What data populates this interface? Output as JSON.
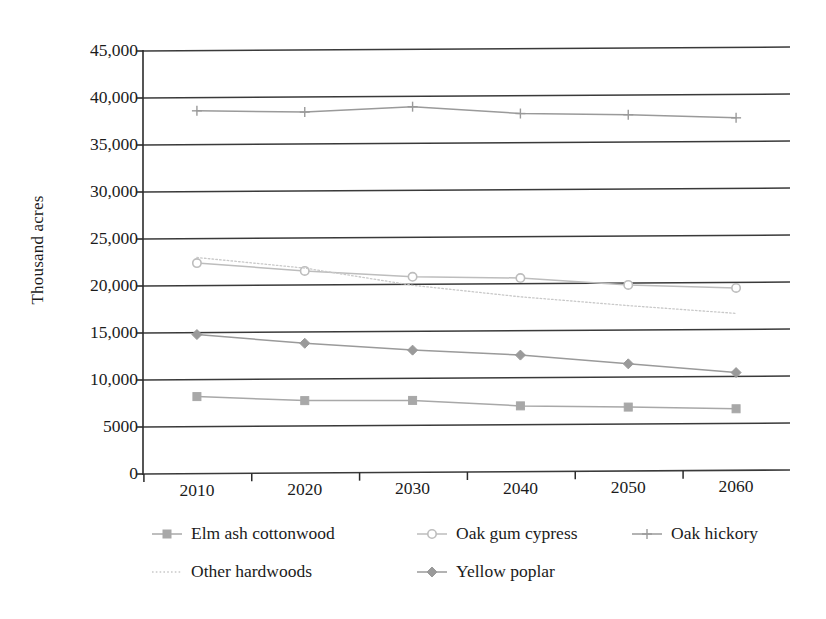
{
  "chart_data": {
    "type": "line",
    "title": "",
    "xlabel": "",
    "ylabel": "Thousand acres",
    "x": [
      2010,
      2020,
      2030,
      2040,
      2050,
      2060
    ],
    "categories": [
      "2010",
      "2020",
      "2030",
      "2040",
      "2050",
      "2060"
    ],
    "xlim": [
      2005,
      2065
    ],
    "ylim": [
      0,
      45000
    ],
    "ytick_labels": [
      "0",
      "5000",
      "10,000",
      "15,000",
      "20,000",
      "25,000",
      "30,000",
      "35,000",
      "40,000",
      "45,000"
    ],
    "ytick_values": [
      0,
      5000,
      10000,
      15000,
      20000,
      25000,
      30000,
      35000,
      40000,
      45000
    ],
    "grid": "horizontal",
    "legend_position": "bottom",
    "series": [
      {
        "name": "Elm ash cottonwood",
        "marker": "square",
        "color": "#a8a8a8",
        "dash": "none",
        "values": [
          8200,
          7700,
          7650,
          7000,
          6800,
          6550
        ]
      },
      {
        "name": "Oak gum cypress",
        "marker": "circle",
        "color": "#bdbdbd",
        "dash": "none",
        "values": [
          22400,
          21500,
          20800,
          20600,
          19800,
          19400
        ]
      },
      {
        "name": "Oak hickory",
        "marker": "plus",
        "color": "#9a9a9a",
        "dash": "none",
        "values": [
          38600,
          38400,
          38900,
          38100,
          37900,
          37500
        ]
      },
      {
        "name": "Other hardwoods",
        "marker": "none",
        "color": "#c9c9c9",
        "dash": "dotted",
        "values": [
          23000,
          21800,
          19900,
          18600,
          17600,
          16700
        ]
      },
      {
        "name": "Yellow poplar",
        "marker": "diamond",
        "color": "#9a9a9a",
        "dash": "none",
        "values": [
          14800,
          13800,
          13000,
          12400,
          11400,
          10400
        ]
      }
    ]
  },
  "axis": {
    "y_title": "Thousand acres"
  },
  "legend": {
    "items": [
      {
        "label": "Elm ash cottonwood",
        "marker": "square",
        "color": "#a8a8a8",
        "dash": "none"
      },
      {
        "label": "Oak gum cypress",
        "marker": "circle",
        "color": "#bdbdbd",
        "dash": "none"
      },
      {
        "label": "Oak hickory",
        "marker": "plus",
        "color": "#9a9a9a",
        "dash": "none"
      },
      {
        "label": "Other hardwoods",
        "marker": "none",
        "color": "#c9c9c9",
        "dash": "dotted"
      },
      {
        "label": "Yellow poplar",
        "marker": "diamond",
        "color": "#9a9a9a",
        "dash": "none"
      }
    ]
  },
  "colors": {
    "axis": "#2b2b2b",
    "gridline": "#3a3a3a",
    "text": "#1b1b1b",
    "background": "#ffffff"
  }
}
